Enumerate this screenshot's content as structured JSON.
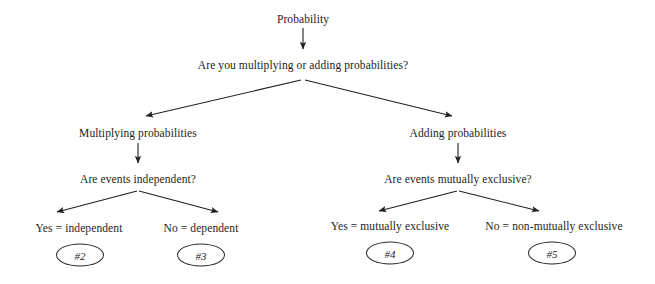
{
  "diagram": {
    "background_color": "#ffffff",
    "line_color": "#1f1f1f",
    "text_color": "#1d1d1d",
    "nodes": {
      "root": "Probability",
      "question_1": "Are you multiplying or adding probabilities?",
      "branch_left": "Multiplying probabilities",
      "branch_right": "Adding probabilities",
      "question_left": "Are events independent?",
      "question_right": "Are events mutually exclusive?",
      "leaf_1": "Yes = independent",
      "leaf_2": "No = dependent",
      "leaf_3": "Yes = mutually exclusive",
      "leaf_4": "No = non-mutually exclusive"
    },
    "badges": {
      "badge_1": "#2",
      "badge_2": "#3",
      "badge_3": "#4",
      "badge_4": "#5"
    }
  }
}
